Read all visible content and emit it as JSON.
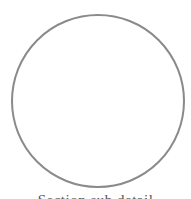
{
  "diagram": {
    "shape": "circle",
    "stroke_color": "#8a8a8a",
    "fill_color": "#ffffff"
  },
  "caption": {
    "text": "Section sub detail",
    "clipped": true
  }
}
